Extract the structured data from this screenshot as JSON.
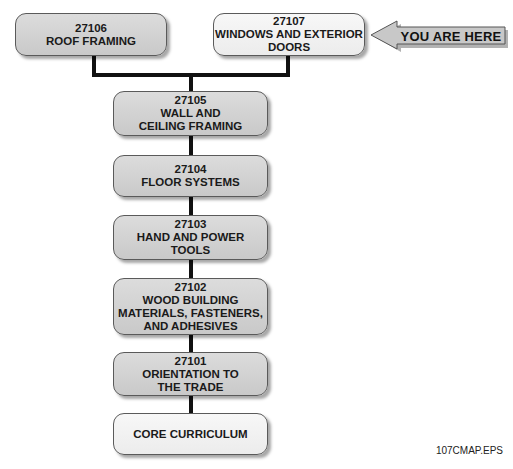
{
  "diagram": {
    "modules": [
      {
        "code": "27106",
        "lines": [
          "ROOF FRAMING"
        ]
      },
      {
        "code": "27107",
        "lines": [
          "WINDOWS AND EXTERIOR",
          "DOORS"
        ],
        "current": true
      },
      {
        "code": "27105",
        "lines": [
          "WALL AND",
          "CEILING FRAMING"
        ]
      },
      {
        "code": "27104",
        "lines": [
          "FLOOR SYSTEMS"
        ]
      },
      {
        "code": "27103",
        "lines": [
          "HAND AND POWER",
          "TOOLS"
        ]
      },
      {
        "code": "27102",
        "lines": [
          "WOOD BUILDING",
          "MATERIALS, FASTENERS,",
          "AND ADHESIVES"
        ]
      },
      {
        "code": "27101",
        "lines": [
          "ORIENTATION TO",
          "THE TRADE"
        ]
      },
      {
        "code": "",
        "lines": [
          "CORE CURRICULUM"
        ]
      }
    ],
    "pointer": {
      "label": "YOU ARE HERE",
      "target": "27107"
    },
    "caption": "107CMAP.EPS",
    "colors": {
      "box_fill": "#d3d3d3",
      "box_fill_light": "#f2f2f2",
      "border": "#5a5a5a",
      "connector": "#111111",
      "arrow_fill": "#c8c8c8"
    }
  }
}
